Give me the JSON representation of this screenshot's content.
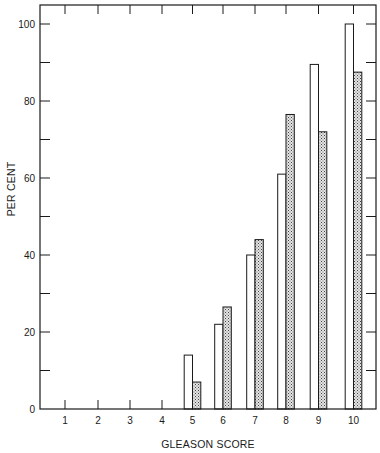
{
  "chart_data": {
    "type": "bar",
    "title": "",
    "xlabel": "GLEASON SCORE",
    "ylabel": "PER CENT",
    "categories": [
      "1",
      "2",
      "3",
      "4",
      "5",
      "6",
      "7",
      "8",
      "9",
      "10"
    ],
    "series": [
      {
        "name": "Series A (open bars)",
        "fill": "open",
        "values": [
          0,
          0,
          0,
          0,
          14,
          22,
          40,
          61,
          89.5,
          100
        ]
      },
      {
        "name": "Series B (stippled bars)",
        "fill": "stippled",
        "values": [
          0,
          0,
          0,
          0,
          7,
          26.5,
          44,
          76.5,
          72,
          87.5
        ]
      }
    ],
    "ylim": [
      0,
      100
    ],
    "y_major_ticks": [
      0,
      20,
      40,
      60,
      80,
      100
    ],
    "y_minor_ticks": [
      10,
      30,
      50,
      70,
      90
    ],
    "grid": false,
    "legend": "none",
    "frame": "box with inward ticks on all sides"
  },
  "colors": {
    "ink": "#1a1a1a",
    "open_fill": "#ffffff",
    "stipple_bg": "#d9d9d9",
    "stipple_dot": "#555555"
  }
}
